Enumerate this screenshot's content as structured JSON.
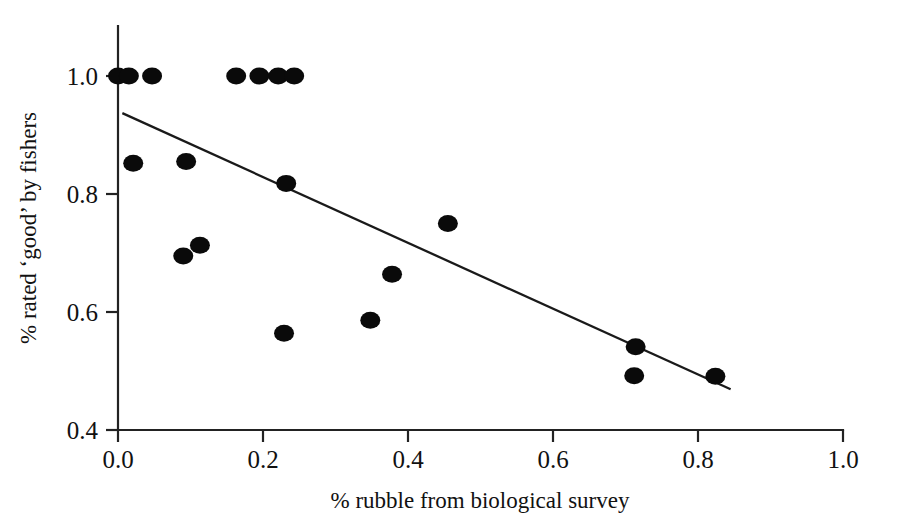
{
  "chart_data": {
    "type": "scatter",
    "title": "",
    "xlabel": "% rubble from biological survey",
    "ylabel": "% rated ‘good’ by fishers",
    "xlim": [
      0.0,
      1.0
    ],
    "ylim": [
      0.4,
      1.0
    ],
    "xticks": [
      0.0,
      0.2,
      0.4,
      0.6,
      0.8,
      1.0
    ],
    "xtick_labels": [
      "0.0",
      "0.2",
      "0.4",
      "0.6",
      "0.8",
      "1.0"
    ],
    "yticks": [
      0.4,
      0.6,
      0.8,
      1.0
    ],
    "ytick_labels": [
      "0.4",
      "0.6",
      "0.8",
      "1.0"
    ],
    "grid": false,
    "legend": false,
    "legend_position": "none",
    "marker": "filled-circle",
    "marker_color": "#0a0a0a",
    "line_color": "#1a1a1a",
    "points": [
      {
        "x": 0.0,
        "y": 1.0
      },
      {
        "x": 0.015,
        "y": 1.0
      },
      {
        "x": 0.047,
        "y": 1.0
      },
      {
        "x": 0.163,
        "y": 1.0
      },
      {
        "x": 0.195,
        "y": 1.0
      },
      {
        "x": 0.221,
        "y": 1.0
      },
      {
        "x": 0.243,
        "y": 1.0
      },
      {
        "x": 0.021,
        "y": 0.852
      },
      {
        "x": 0.094,
        "y": 0.855
      },
      {
        "x": 0.232,
        "y": 0.818
      },
      {
        "x": 0.09,
        "y": 0.695
      },
      {
        "x": 0.113,
        "y": 0.713
      },
      {
        "x": 0.455,
        "y": 0.75
      },
      {
        "x": 0.378,
        "y": 0.664
      },
      {
        "x": 0.348,
        "y": 0.586
      },
      {
        "x": 0.229,
        "y": 0.564
      },
      {
        "x": 0.714,
        "y": 0.541
      },
      {
        "x": 0.712,
        "y": 0.492
      },
      {
        "x": 0.824,
        "y": 0.491
      }
    ],
    "trend_line": {
      "label": "linear fit",
      "x_start": 0.006,
      "y_start": 0.937,
      "x_end": 0.845,
      "y_end": 0.469,
      "slope": -0.558,
      "intercept": 0.94
    }
  }
}
